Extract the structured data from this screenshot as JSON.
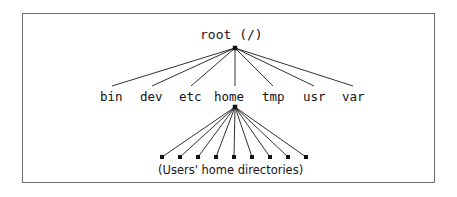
{
  "diagram": {
    "title_text": "root (/)",
    "root": {
      "label": "root (/)",
      "x": 235,
      "y": 48
    },
    "frame": {
      "border_color": "#6e6e72",
      "background": "#ffffff"
    },
    "line_color": "#1a1a1e",
    "node_marker_color": "#111114",
    "directories": [
      {
        "label": "bin",
        "label_x": 100,
        "anchor_x": 112,
        "anchor_y": 86
      },
      {
        "label": "dev",
        "label_x": 140,
        "anchor_x": 152,
        "anchor_y": 86
      },
      {
        "label": "etc",
        "label_x": 179,
        "anchor_x": 191,
        "anchor_y": 86
      },
      {
        "label": "home",
        "label_x": 214,
        "anchor_x": 235,
        "anchor_y": 86
      },
      {
        "label": "tmp",
        "label_x": 262,
        "anchor_x": 273,
        "anchor_y": 86
      },
      {
        "label": "usr",
        "label_x": 303,
        "anchor_x": 314,
        "anchor_y": 86
      },
      {
        "label": "var",
        "label_x": 342,
        "anchor_x": 353,
        "anchor_y": 86
      }
    ],
    "home_junction": {
      "x": 235,
      "y": 107
    },
    "home_children": [
      {
        "x": 162,
        "y": 157
      },
      {
        "x": 180,
        "y": 157
      },
      {
        "x": 198,
        "y": 157
      },
      {
        "x": 216,
        "y": 157
      },
      {
        "x": 234,
        "y": 157
      },
      {
        "x": 252,
        "y": 157
      },
      {
        "x": 270,
        "y": 157
      },
      {
        "x": 288,
        "y": 157
      },
      {
        "x": 306,
        "y": 157
      }
    ],
    "leaf_marker_size": 4,
    "caption": "(Users' home directories)"
  }
}
